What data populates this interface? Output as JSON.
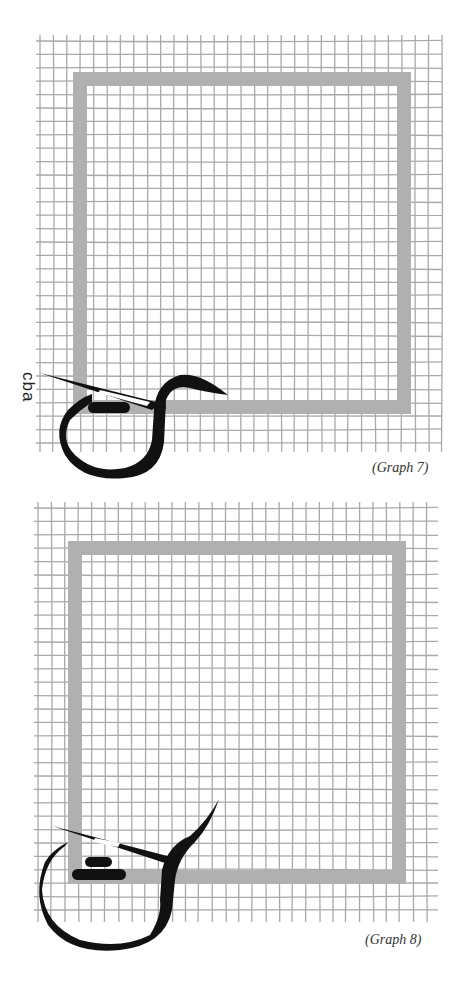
{
  "figures": [
    {
      "caption": "(Graph 7)",
      "side_label": "cba",
      "grid": {
        "x0": 40,
        "y0": 35,
        "x1": 442,
        "y1": 452,
        "step": 13.4,
        "color": "#a9a9a9"
      },
      "frame": {
        "x": 80,
        "y": 79,
        "w": 324,
        "h": 328,
        "stroke": 14,
        "color": "#b0b0b0"
      },
      "glyph_color": "#111111"
    },
    {
      "caption": "(Graph 8)",
      "grid": {
        "x0": 38,
        "y0": 502,
        "x1": 438,
        "y1": 922,
        "step": 13.4,
        "color": "#a9a9a9"
      },
      "frame": {
        "x": 75,
        "y": 548,
        "w": 324,
        "h": 329,
        "stroke": 14,
        "color": "#b0b0b0"
      },
      "glyph_color": "#111111"
    }
  ]
}
